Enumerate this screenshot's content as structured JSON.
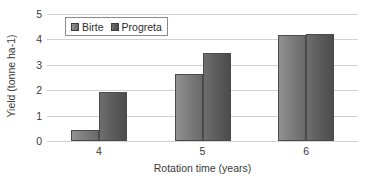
{
  "chart_data": {
    "type": "bar",
    "title": "",
    "xlabel": "Rotation time (years)",
    "ylabel": "Yield (tonne ha-1)",
    "categories": [
      "4",
      "5",
      "6"
    ],
    "series": [
      {
        "name": "Birte",
        "values": [
          0.43,
          2.64,
          4.18
        ],
        "color": "#7e7e7e"
      },
      {
        "name": "Progreta",
        "values": [
          1.93,
          3.47,
          4.22
        ],
        "color": "#5d5d5d"
      }
    ],
    "ylim": [
      0,
      5
    ],
    "yticks": [
      "0",
      "1",
      "2",
      "3",
      "4",
      "5"
    ],
    "grid": true,
    "legend_position": "top-left"
  },
  "legend": {
    "items": [
      {
        "label": "Birte"
      },
      {
        "label": "Progreta"
      }
    ]
  },
  "axes": {
    "y_title": "Yield (tonne ha-1)",
    "x_title": "Rotation time (years)"
  }
}
